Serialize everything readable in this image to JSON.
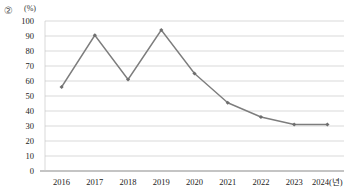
{
  "annotation": {
    "circled_number": "②",
    "unit_label": "(%)"
  },
  "chart_data": {
    "type": "line",
    "title": "",
    "subtitle": "",
    "xlabel": "",
    "ylabel": "(%)",
    "x_axis_suffix": "(년)",
    "categories": [
      "2016",
      "2017",
      "2018",
      "2019",
      "2020",
      "2021",
      "2022",
      "2023",
      "2024"
    ],
    "x_tick_labels": [
      "2016",
      "2017",
      "2018",
      "2019",
      "2020",
      "2021",
      "2022",
      "2023",
      "2024(년)"
    ],
    "values": [
      56,
      90.5,
      61,
      94,
      65,
      45.5,
      36,
      31,
      31
    ],
    "ylim": [
      0,
      100
    ],
    "y_ticks": [
      0,
      10,
      20,
      30,
      40,
      50,
      60,
      70,
      80,
      90,
      100
    ],
    "y_tick_labels": [
      "0",
      "10",
      "20",
      "30",
      "40",
      "50",
      "60",
      "70",
      "80",
      "90",
      "100"
    ],
    "grid": true,
    "grid_axis": "y",
    "legend": false,
    "legend_position": "none",
    "series": [
      {
        "name": "",
        "values": [
          56,
          90.5,
          61,
          94,
          65,
          45.5,
          36,
          31,
          31
        ],
        "color": "#7d7d7d",
        "marker": "diamond",
        "marker_color": "#6e6e6e"
      }
    ],
    "colors": {
      "line": "#7d7d7d",
      "marker": "#6e6e6e",
      "grid": "#c9c9c9",
      "axis": "#8a8a8a",
      "text": "#222222"
    }
  }
}
